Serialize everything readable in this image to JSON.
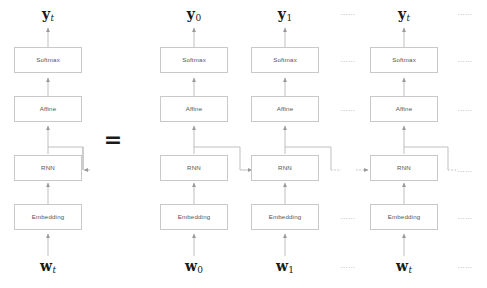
{
  "diagram": {
    "title_alt": "RNN unrolled through time",
    "equals_sign": "=",
    "ellipsis": "……",
    "colors": {
      "box_border": "#c9c9c9",
      "box_fill": "#ffffff",
      "wire": "#b4b4b4",
      "label_text": "#555555",
      "math_text": "#1a1a1a",
      "ellipsis_text": "#9d9d9d",
      "background": "#ffffff"
    },
    "layer_names": {
      "softmax": "Softmax",
      "affine": "Affine",
      "rnn": "RNN",
      "embedding": "Embedding"
    },
    "columns": [
      {
        "id": "folded",
        "center_x": 48,
        "output_label": {
          "symbol": "y",
          "subscript": "t",
          "subscript_style": "italic"
        },
        "input_label": {
          "symbol": "w",
          "subscript": "t",
          "subscript_style": "italic"
        },
        "layers": [
          "Softmax",
          "Affine",
          "RNN",
          "Embedding"
        ],
        "self_loop": true
      },
      {
        "id": "t0",
        "center_x": 194,
        "output_label": {
          "symbol": "y",
          "subscript": "0",
          "subscript_style": "upright"
        },
        "input_label": {
          "symbol": "w",
          "subscript": "0",
          "subscript_style": "upright"
        },
        "layers": [
          "Softmax",
          "Affine",
          "RNN",
          "Embedding"
        ],
        "self_loop": false
      },
      {
        "id": "t1",
        "center_x": 285,
        "output_label": {
          "symbol": "y",
          "subscript": "1",
          "subscript_style": "upright"
        },
        "input_label": {
          "symbol": "w",
          "subscript": "1",
          "subscript_style": "upright"
        },
        "layers": [
          "Softmax",
          "Affine",
          "RNN",
          "Embedding"
        ],
        "self_loop": false
      },
      {
        "id": "tt",
        "center_x": 404,
        "output_label": {
          "symbol": "y",
          "subscript": "t",
          "subscript_style": "italic"
        },
        "input_label": {
          "symbol": "w",
          "subscript": "t",
          "subscript_style": "italic"
        },
        "layers": [
          "Softmax",
          "Affine",
          "RNN",
          "Embedding"
        ],
        "self_loop": false
      }
    ],
    "ellipsis_columns": [
      {
        "id": "gap-mid",
        "center_x": 348
      },
      {
        "id": "gap-right",
        "center_x": 465
      }
    ],
    "ellipsis_rows": [
      13,
      68,
      117,
      168,
      221,
      270
    ]
  }
}
